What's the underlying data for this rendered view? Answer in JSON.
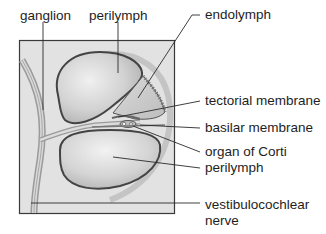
{
  "diagram": {
    "colors": {
      "frame_bg": "#e4e4e4",
      "frame_border": "#3a3a3a",
      "chamber_fill": "#c8c8c8",
      "chamber_highlight": "#eeeeee",
      "outline": "#4a4a4a",
      "text": "#1e1e1e"
    },
    "labels": {
      "ganglion": "ganglion",
      "perilymph_top": "perilymph",
      "endolymph": "endolymph",
      "tectorial_membrane": "tectorial membrane",
      "basilar_membrane": "basilar membrane",
      "organ_of_corti": "organ of Corti",
      "perilymph_bottom": "perilymph",
      "nerve_line1": "vestibulocochlear",
      "nerve_line2": "nerve"
    }
  }
}
